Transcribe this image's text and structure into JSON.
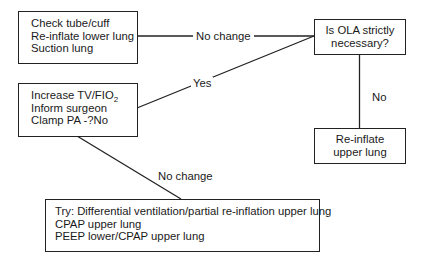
{
  "nodes": {
    "check": {
      "lines": [
        "Check tube/cuff",
        "Re-inflate lower lung",
        "Suction lung"
      ]
    },
    "ola": {
      "lines": [
        "Is OLA strictly",
        "necessary?"
      ]
    },
    "increase": {
      "line1_main": "Increase TV/FIO",
      "line1_sub": "2",
      "lines": [
        "Inform surgeon",
        "Clamp PA -?No"
      ]
    },
    "reinflate_upper": {
      "lines": [
        "Re-inflate",
        "upper lung"
      ]
    },
    "try": {
      "lines": [
        "Try: Differential ventilation/partial re-inflation upper lung",
        "CPAP upper lung",
        "PEEP lower/CPAP upper lung"
      ]
    }
  },
  "edges": {
    "check_to_ola": "No change",
    "ola_to_increase": "Yes",
    "ola_to_reinflate": "No",
    "increase_to_try": "No change"
  },
  "colors": {
    "line": "#222222",
    "background": "#ffffff"
  }
}
